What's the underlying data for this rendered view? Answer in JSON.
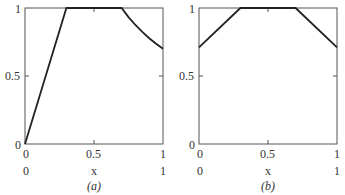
{
  "chart_data": [
    {
      "type": "line",
      "panel_label": "(a)",
      "xlabel": "x",
      "ylabel": "",
      "xlim": [
        0,
        1
      ],
      "ylim": [
        0,
        1
      ],
      "x_ticks": [
        "0",
        "0.5",
        "1"
      ],
      "y_ticks": [
        "0",
        "0.5",
        "1"
      ],
      "x_axis_secondary_ticks": [
        "0",
        "1"
      ],
      "grid": false,
      "series": [
        {
          "name": "curve-a",
          "x": [
            0,
            0.3,
            0.7,
            0.75,
            0.8,
            0.85,
            0.9,
            0.95,
            1.0
          ],
          "y": [
            0,
            1,
            1,
            0.933,
            0.875,
            0.824,
            0.778,
            0.737,
            0.7
          ]
        }
      ]
    },
    {
      "type": "line",
      "panel_label": "(b)",
      "xlabel": "x",
      "ylabel": "",
      "xlim": [
        0,
        1
      ],
      "ylim": [
        0,
        1
      ],
      "x_ticks": [
        "0",
        "0.5",
        "1"
      ],
      "y_ticks": [
        "0",
        "0.5",
        "1"
      ],
      "x_axis_secondary_ticks": [
        "0",
        "1"
      ],
      "grid": false,
      "series": [
        {
          "name": "curve-b",
          "x": [
            0,
            0.3,
            0.7,
            1.0
          ],
          "y": [
            0.71,
            1,
            1,
            0.71
          ]
        }
      ]
    }
  ],
  "panels": [
    {
      "caption": "(a)",
      "xlabel": "x",
      "ytick_0": "0",
      "ytick_05": "0.5",
      "ytick_1": "1",
      "xtick_0": "0",
      "xtick_05": "0.5",
      "xtick_1": "1",
      "xsec_0": "0",
      "xsec_1": "1"
    },
    {
      "caption": "(b)",
      "xlabel": "x",
      "ytick_0": "0",
      "ytick_05": "0.5",
      "ytick_1": "1",
      "xtick_0": "0",
      "xtick_05": "0.5",
      "xtick_1": "1",
      "xsec_0": "0",
      "xsec_1": "1"
    }
  ]
}
